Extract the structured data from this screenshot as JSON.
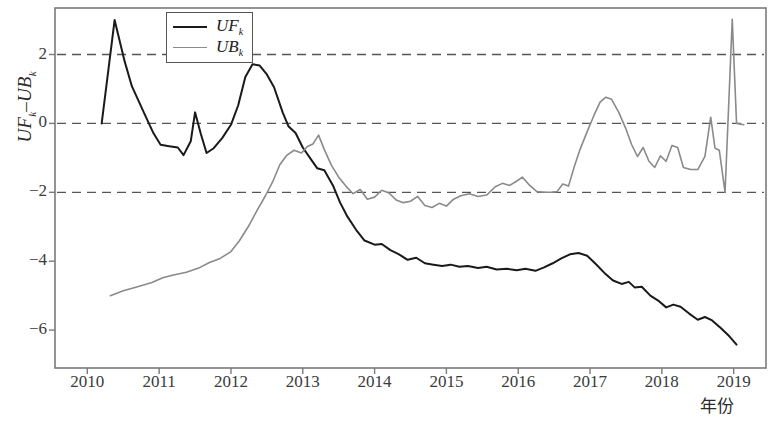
{
  "chart_data": {
    "type": "line",
    "title": "",
    "xlabel": "年份",
    "ylabel": "UF_k-UB_k",
    "ylabel_parts": {
      "first": "UF",
      "first_sub": "k",
      "dash": "–",
      "second": "UB",
      "second_sub": "k"
    },
    "xlim": [
      2009.55,
      2019.45
    ],
    "ylim": [
      -7.1,
      3.35
    ],
    "xticks": [
      2010,
      2011,
      2012,
      2013,
      2014,
      2015,
      2016,
      2017,
      2018,
      2019
    ],
    "xtick_labels": [
      "2010",
      "2011",
      "2012",
      "2013",
      "2014",
      "2015",
      "2016",
      "2017",
      "2018",
      "2019"
    ],
    "yticks": [
      2,
      0,
      -2,
      -4,
      -6
    ],
    "ytick_labels": [
      "2",
      "0",
      "−2",
      "−4",
      "−6"
    ],
    "grid": false,
    "reference_lines": {
      "values": [
        2,
        0,
        -2
      ],
      "style": "dashed",
      "color": "#555555"
    },
    "legend": {
      "position": "top-left-inside",
      "entries": [
        {
          "name": "UF",
          "sub": "k",
          "color": "#1a1a1a"
        },
        {
          "name": "UB",
          "sub": "k",
          "color": "#8a8a8a"
        }
      ]
    },
    "series": [
      {
        "name": "UFk",
        "color": "#1a1a1a",
        "width": 2.0,
        "points": [
          [
            2010.2,
            0.0
          ],
          [
            2010.38,
            3.0
          ],
          [
            2010.52,
            1.8
          ],
          [
            2010.62,
            1.08
          ],
          [
            2010.78,
            0.35
          ],
          [
            2010.92,
            -0.28
          ],
          [
            2011.02,
            -0.62
          ],
          [
            2011.14,
            -0.66
          ],
          [
            2011.26,
            -0.7
          ],
          [
            2011.34,
            -0.92
          ],
          [
            2011.44,
            -0.52
          ],
          [
            2011.5,
            0.32
          ],
          [
            2011.58,
            -0.3
          ],
          [
            2011.66,
            -0.86
          ],
          [
            2011.76,
            -0.72
          ],
          [
            2011.88,
            -0.42
          ],
          [
            2012.0,
            -0.04
          ],
          [
            2012.1,
            0.52
          ],
          [
            2012.2,
            1.35
          ],
          [
            2012.3,
            1.72
          ],
          [
            2012.4,
            1.68
          ],
          [
            2012.5,
            1.42
          ],
          [
            2012.6,
            1.05
          ],
          [
            2012.72,
            0.32
          ],
          [
            2012.8,
            -0.08
          ],
          [
            2012.9,
            -0.28
          ],
          [
            2013.0,
            -0.7
          ],
          [
            2013.1,
            -1.0
          ],
          [
            2013.2,
            -1.3
          ],
          [
            2013.3,
            -1.36
          ],
          [
            2013.42,
            -1.8
          ],
          [
            2013.52,
            -2.3
          ],
          [
            2013.62,
            -2.7
          ],
          [
            2013.74,
            -3.08
          ],
          [
            2013.86,
            -3.4
          ],
          [
            2014.0,
            -3.52
          ],
          [
            2014.1,
            -3.5
          ],
          [
            2014.22,
            -3.68
          ],
          [
            2014.34,
            -3.8
          ],
          [
            2014.46,
            -3.96
          ],
          [
            2014.58,
            -3.9
          ],
          [
            2014.7,
            -4.06
          ],
          [
            2014.82,
            -4.1
          ],
          [
            2014.94,
            -4.14
          ],
          [
            2015.06,
            -4.1
          ],
          [
            2015.18,
            -4.16
          ],
          [
            2015.3,
            -4.14
          ],
          [
            2015.44,
            -4.2
          ],
          [
            2015.56,
            -4.16
          ],
          [
            2015.7,
            -4.24
          ],
          [
            2015.84,
            -4.22
          ],
          [
            2015.98,
            -4.26
          ],
          [
            2016.1,
            -4.22
          ],
          [
            2016.24,
            -4.28
          ],
          [
            2016.36,
            -4.18
          ],
          [
            2016.48,
            -4.06
          ],
          [
            2016.6,
            -3.92
          ],
          [
            2016.72,
            -3.8
          ],
          [
            2016.84,
            -3.76
          ],
          [
            2016.96,
            -3.84
          ],
          [
            2017.08,
            -4.08
          ],
          [
            2017.2,
            -4.34
          ],
          [
            2017.32,
            -4.56
          ],
          [
            2017.44,
            -4.66
          ],
          [
            2017.54,
            -4.6
          ],
          [
            2017.62,
            -4.76
          ],
          [
            2017.72,
            -4.74
          ],
          [
            2017.84,
            -5.0
          ],
          [
            2017.96,
            -5.16
          ],
          [
            2018.06,
            -5.34
          ],
          [
            2018.16,
            -5.26
          ],
          [
            2018.26,
            -5.32
          ],
          [
            2018.38,
            -5.52
          ],
          [
            2018.5,
            -5.7
          ],
          [
            2018.6,
            -5.62
          ],
          [
            2018.7,
            -5.72
          ],
          [
            2018.82,
            -5.94
          ],
          [
            2018.94,
            -6.18
          ],
          [
            2019.04,
            -6.42
          ]
        ]
      },
      {
        "name": "UBk",
        "color": "#8a8a8a",
        "width": 1.6,
        "points": [
          [
            2010.32,
            -5.0
          ],
          [
            2010.5,
            -4.86
          ],
          [
            2010.7,
            -4.74
          ],
          [
            2010.9,
            -4.62
          ],
          [
            2011.05,
            -4.48
          ],
          [
            2011.2,
            -4.4
          ],
          [
            2011.38,
            -4.32
          ],
          [
            2011.55,
            -4.2
          ],
          [
            2011.7,
            -4.04
          ],
          [
            2011.85,
            -3.92
          ],
          [
            2012.0,
            -3.72
          ],
          [
            2012.12,
            -3.4
          ],
          [
            2012.24,
            -3.0
          ],
          [
            2012.36,
            -2.54
          ],
          [
            2012.48,
            -2.1
          ],
          [
            2012.58,
            -1.7
          ],
          [
            2012.68,
            -1.2
          ],
          [
            2012.78,
            -0.92
          ],
          [
            2012.88,
            -0.78
          ],
          [
            2012.98,
            -0.86
          ],
          [
            2013.06,
            -0.68
          ],
          [
            2013.14,
            -0.6
          ],
          [
            2013.22,
            -0.34
          ],
          [
            2013.3,
            -0.76
          ],
          [
            2013.4,
            -1.22
          ],
          [
            2013.5,
            -1.56
          ],
          [
            2013.6,
            -1.82
          ],
          [
            2013.7,
            -2.04
          ],
          [
            2013.8,
            -1.92
          ],
          [
            2013.9,
            -2.2
          ],
          [
            2014.0,
            -2.14
          ],
          [
            2014.1,
            -1.94
          ],
          [
            2014.2,
            -2.02
          ],
          [
            2014.3,
            -2.22
          ],
          [
            2014.4,
            -2.3
          ],
          [
            2014.5,
            -2.26
          ],
          [
            2014.6,
            -2.12
          ],
          [
            2014.7,
            -2.38
          ],
          [
            2014.8,
            -2.44
          ],
          [
            2014.9,
            -2.32
          ],
          [
            2015.0,
            -2.4
          ],
          [
            2015.1,
            -2.2
          ],
          [
            2015.2,
            -2.1
          ],
          [
            2015.32,
            -2.04
          ],
          [
            2015.44,
            -2.12
          ],
          [
            2015.56,
            -2.08
          ],
          [
            2015.68,
            -1.84
          ],
          [
            2015.78,
            -1.74
          ],
          [
            2015.88,
            -1.8
          ],
          [
            2015.96,
            -1.7
          ],
          [
            2016.06,
            -1.56
          ],
          [
            2016.16,
            -1.8
          ],
          [
            2016.26,
            -1.98
          ],
          [
            2016.36,
            -2.0
          ],
          [
            2016.46,
            -2.0
          ],
          [
            2016.54,
            -1.98
          ],
          [
            2016.62,
            -1.76
          ],
          [
            2016.7,
            -1.82
          ],
          [
            2016.78,
            -1.26
          ],
          [
            2016.86,
            -0.76
          ],
          [
            2016.96,
            -0.24
          ],
          [
            2017.06,
            0.26
          ],
          [
            2017.14,
            0.62
          ],
          [
            2017.22,
            0.76
          ],
          [
            2017.3,
            0.7
          ],
          [
            2017.4,
            0.32
          ],
          [
            2017.5,
            -0.16
          ],
          [
            2017.58,
            -0.62
          ],
          [
            2017.66,
            -0.96
          ],
          [
            2017.74,
            -0.7
          ],
          [
            2017.82,
            -1.1
          ],
          [
            2017.9,
            -1.28
          ],
          [
            2017.98,
            -0.94
          ],
          [
            2018.06,
            -1.1
          ],
          [
            2018.14,
            -0.64
          ],
          [
            2018.22,
            -0.7
          ],
          [
            2018.3,
            -1.28
          ],
          [
            2018.4,
            -1.34
          ],
          [
            2018.5,
            -1.34
          ],
          [
            2018.6,
            -0.96
          ],
          [
            2018.68,
            0.18
          ],
          [
            2018.74,
            -0.72
          ],
          [
            2018.8,
            -0.78
          ],
          [
            2018.88,
            -2.0
          ],
          [
            2018.98,
            3.02
          ],
          [
            2019.04,
            0.0
          ],
          [
            2019.14,
            -0.04
          ]
        ]
      }
    ]
  }
}
